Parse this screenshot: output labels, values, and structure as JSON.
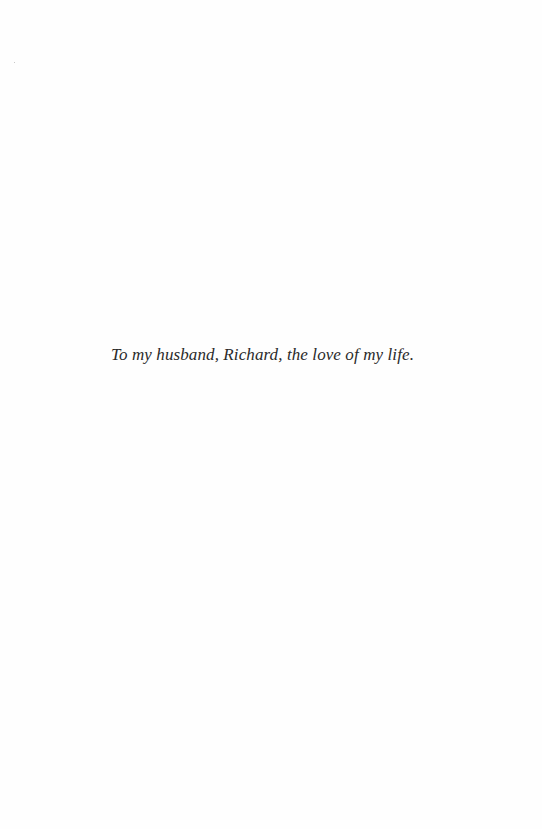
{
  "page": {
    "dedication": "To my husband, Richard, the love of my life."
  },
  "colors": {
    "background": "#fefefe",
    "text": "#2a2a2a"
  }
}
